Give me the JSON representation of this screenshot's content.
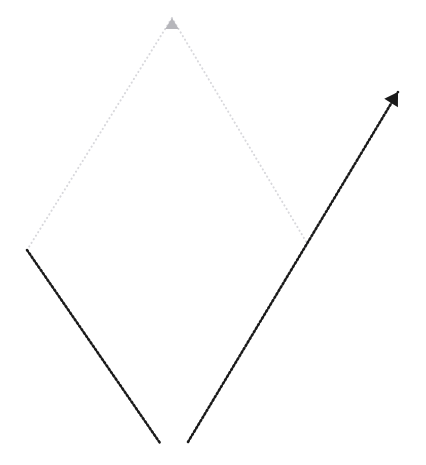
{
  "canvas": {
    "width": 426,
    "height": 465,
    "background_color": "#ffffff",
    "title": "Dotted rhombus path with arrows"
  },
  "style": {
    "faint_stroke_color": "#d8d8dc",
    "faint_stroke_width": 2.0,
    "faint_dash": "0.2 4.0",
    "dark_stroke_color": "#1a1a1a",
    "dark_stroke_width": 2.6,
    "dark_dash": "1.6 2.4",
    "line_cap": "round",
    "arrow_faint_color": "#b6b6bb",
    "arrow_dark_color": "#1a1a1a"
  },
  "vertices": {
    "top_apex": {
      "label": "top-apex",
      "x": 172,
      "y": 18
    },
    "left_vertex": {
      "label": "left-vertex",
      "x": 27,
      "y": 250
    },
    "right_vertex": {
      "label": "right-vertex",
      "x": 307,
      "y": 243
    },
    "bottom_left_end": {
      "label": "bottom-left-end",
      "x": 160,
      "y": 443
    },
    "bottom_right_start": {
      "label": "bottom-right-start",
      "x": 188,
      "y": 442
    },
    "arrow_tip": {
      "label": "arrow-tip",
      "x": 398,
      "y": 92
    }
  },
  "segments": [
    {
      "name": "upper-left-edge",
      "from": "left_vertex",
      "to": "top_apex",
      "tone": "faint",
      "description": "Faint grey dotted line rising from the left vertex to the top apex"
    },
    {
      "name": "upper-right-edge",
      "from": "top_apex",
      "to": "right_vertex",
      "tone": "faint",
      "description": "Faint grey dotted line descending from the top apex to the right vertex"
    },
    {
      "name": "lower-left-edge",
      "from": "left_vertex",
      "to": "bottom_left_end",
      "tone": "dark",
      "description": "Dark dotted line descending from the left vertex toward the bottom"
    },
    {
      "name": "lower-right-edge",
      "from": "bottom_right_start",
      "to": "arrow_tip",
      "tone": "dark",
      "description": "Dark dotted line rising from the bottom gap through the right vertex to the arrow tip"
    }
  ],
  "arrows": [
    {
      "name": "top-apex-arrowhead",
      "tone": "faint",
      "x": 172,
      "y": 18,
      "angle_deg": -90,
      "size": 11,
      "color": "#b6b6bb"
    },
    {
      "name": "upper-right-arrowhead",
      "tone": "dark",
      "x": 398,
      "y": 92,
      "angle_deg": -58,
      "size": 13,
      "color": "#1a1a1a"
    }
  ],
  "gap": {
    "name": "bottom-gap",
    "between": [
      "bottom_left_end",
      "bottom_right_start"
    ],
    "width_px": 28
  }
}
